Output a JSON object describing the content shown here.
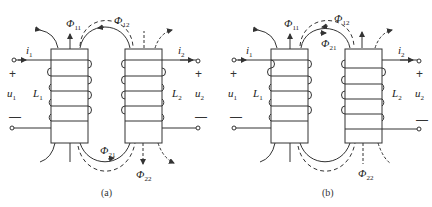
{
  "figure": {
    "panels": [
      {
        "caption": "(a)",
        "coil1": {
          "label": "L",
          "label_sub": "1",
          "current": "i",
          "current_sub": "1",
          "voltage": "u",
          "voltage_sub": "1",
          "plus": "+",
          "minus": "—"
        },
        "coil2": {
          "label": "L",
          "label_sub": "2",
          "current": "i",
          "current_sub": "2",
          "voltage": "u",
          "voltage_sub": "2",
          "plus": "+",
          "minus": "—"
        },
        "flux": [
          {
            "symbol": "Φ",
            "sub": "11"
          },
          {
            "symbol": "Φ",
            "sub": "12"
          },
          {
            "symbol": "Φ",
            "sub": "21"
          },
          {
            "symbol": "Φ",
            "sub": "22"
          }
        ]
      },
      {
        "caption": "(b)",
        "coil1": {
          "label": "L",
          "label_sub": "1",
          "current": "i",
          "current_sub": "1",
          "voltage": "u",
          "voltage_sub": "1",
          "plus": "+",
          "minus": "—"
        },
        "coil2": {
          "label": "L",
          "label_sub": "2",
          "current": "i",
          "current_sub": "2",
          "voltage": "u",
          "voltage_sub": "2",
          "plus": "+",
          "minus": "—"
        },
        "flux": [
          {
            "symbol": "Φ",
            "sub": "11"
          },
          {
            "symbol": "Φ",
            "sub": "12"
          },
          {
            "symbol": "Φ",
            "sub": "21"
          },
          {
            "symbol": "Φ",
            "sub": "22"
          }
        ]
      }
    ]
  },
  "style": {
    "stroke": "#333333",
    "background": "#ffffff"
  }
}
